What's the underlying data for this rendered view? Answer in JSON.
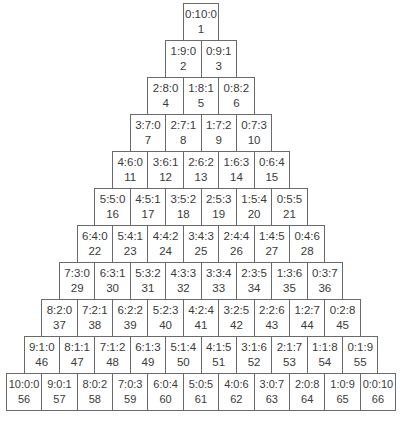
{
  "diagram": {
    "type": "triangular-grid",
    "rows": [
      [
        {
          "ratio": "0:10:0",
          "num": "1"
        }
      ],
      [
        {
          "ratio": "1:9:0",
          "num": "2"
        },
        {
          "ratio": "0:9:1",
          "num": "3"
        }
      ],
      [
        {
          "ratio": "2:8:0",
          "num": "4"
        },
        {
          "ratio": "1:8:1",
          "num": "5"
        },
        {
          "ratio": "0:8:2",
          "num": "6"
        }
      ],
      [
        {
          "ratio": "3:7:0",
          "num": "7"
        },
        {
          "ratio": "2:7:1",
          "num": "8"
        },
        {
          "ratio": "1:7:2",
          "num": "9"
        },
        {
          "ratio": "0:7:3",
          "num": "10"
        }
      ],
      [
        {
          "ratio": "4:6:0",
          "num": "11"
        },
        {
          "ratio": "3:6:1",
          "num": "12"
        },
        {
          "ratio": "2:6:2",
          "num": "13"
        },
        {
          "ratio": "1:6:3",
          "num": "14"
        },
        {
          "ratio": "0:6:4",
          "num": "15"
        }
      ],
      [
        {
          "ratio": "5:5:0",
          "num": "16"
        },
        {
          "ratio": "4:5:1",
          "num": "17"
        },
        {
          "ratio": "3:5:2",
          "num": "18"
        },
        {
          "ratio": "2:5:3",
          "num": "19"
        },
        {
          "ratio": "1:5:4",
          "num": "20"
        },
        {
          "ratio": "0:5:5",
          "num": "21"
        }
      ],
      [
        {
          "ratio": "6:4:0",
          "num": "22"
        },
        {
          "ratio": "5:4:1",
          "num": "23"
        },
        {
          "ratio": "4:4:2",
          "num": "24"
        },
        {
          "ratio": "3:4:3",
          "num": "25"
        },
        {
          "ratio": "2:4:4",
          "num": "26"
        },
        {
          "ratio": "1:4:5",
          "num": "27"
        },
        {
          "ratio": "0:4:6",
          "num": "28"
        }
      ],
      [
        {
          "ratio": "7:3:0",
          "num": "29"
        },
        {
          "ratio": "6:3:1",
          "num": "30"
        },
        {
          "ratio": "5:3:2",
          "num": "31"
        },
        {
          "ratio": "4:3:3",
          "num": "32"
        },
        {
          "ratio": "3:3:4",
          "num": "33"
        },
        {
          "ratio": "2:3:5",
          "num": "34"
        },
        {
          "ratio": "1:3:6",
          "num": "35"
        },
        {
          "ratio": "0:3:7",
          "num": "36"
        }
      ],
      [
        {
          "ratio": "8:2:0",
          "num": "37"
        },
        {
          "ratio": "7:2:1",
          "num": "38"
        },
        {
          "ratio": "6:2:2",
          "num": "39"
        },
        {
          "ratio": "5:2:3",
          "num": "40"
        },
        {
          "ratio": "4:2:4",
          "num": "41"
        },
        {
          "ratio": "3:2:5",
          "num": "42"
        },
        {
          "ratio": "2:2:6",
          "num": "43"
        },
        {
          "ratio": "1:2:7",
          "num": "44"
        },
        {
          "ratio": "0:2:8",
          "num": "45"
        }
      ],
      [
        {
          "ratio": "9:1:0",
          "num": "46"
        },
        {
          "ratio": "8:1:1",
          "num": "47"
        },
        {
          "ratio": "7:1:2",
          "num": "48"
        },
        {
          "ratio": "6:1:3",
          "num": "49"
        },
        {
          "ratio": "5:1:4",
          "num": "50"
        },
        {
          "ratio": "4:1:5",
          "num": "51"
        },
        {
          "ratio": "3:1:6",
          "num": "52"
        },
        {
          "ratio": "2:1:7",
          "num": "53"
        },
        {
          "ratio": "1:1:8",
          "num": "54"
        },
        {
          "ratio": "0:1:9",
          "num": "55"
        }
      ],
      [
        {
          "ratio": "10:0:0",
          "num": "56"
        },
        {
          "ratio": "9:0:1",
          "num": "57"
        },
        {
          "ratio": "8:0:2",
          "num": "58"
        },
        {
          "ratio": "7:0:3",
          "num": "59"
        },
        {
          "ratio": "6:0:4",
          "num": "60"
        },
        {
          "ratio": "5:0:5",
          "num": "61"
        },
        {
          "ratio": "4:0:6",
          "num": "62"
        },
        {
          "ratio": "3:0:7",
          "num": "63"
        },
        {
          "ratio": "2:0:8",
          "num": "64"
        },
        {
          "ratio": "1:0:9",
          "num": "65"
        },
        {
          "ratio": "0:0:10",
          "num": "66"
        }
      ]
    ]
  },
  "colors": {
    "border": "#6a6a6a",
    "text": "#3a3a3a",
    "background": "#ffffff"
  }
}
